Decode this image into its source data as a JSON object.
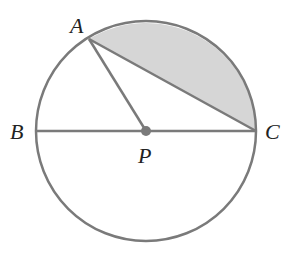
{
  "diagram": {
    "points": {
      "A": {
        "label": "A"
      },
      "B": {
        "label": "B"
      },
      "C": {
        "label": "C"
      },
      "P": {
        "label": "P"
      }
    },
    "colors": {
      "stroke": "#7a7a7a",
      "shade": "#d6d6d6",
      "center_dot": "#7a7a7a",
      "label": "#222222"
    }
  }
}
